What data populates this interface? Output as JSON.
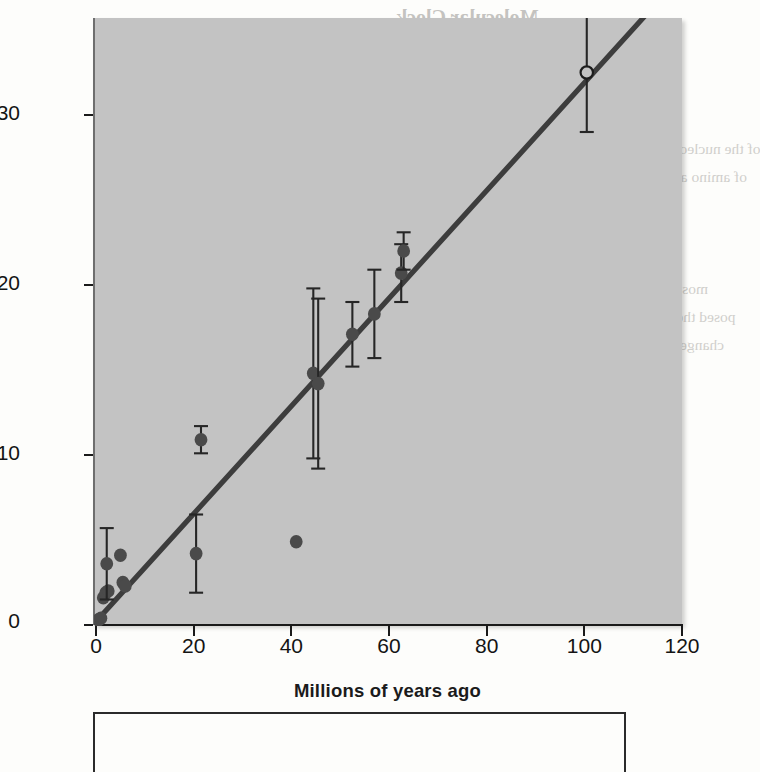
{
  "chart_data": {
    "type": "scatter",
    "title": "",
    "xlabel": "Millions of years ago",
    "ylabel": "Average number of amino acid replacements",
    "xlim": [
      0,
      120
    ],
    "ylim": [
      0,
      37
    ],
    "xticks": [
      0,
      20,
      40,
      60,
      80,
      100,
      120
    ],
    "yticks": [
      0,
      10,
      20,
      30
    ],
    "grid": false,
    "legend": "none",
    "series": [
      {
        "name": "Amino acid replacements vs divergence time",
        "marker": "filled-circle",
        "color": "#4a4a4a",
        "points": [
          {
            "x": 0.5,
            "y": 0.3,
            "err": 0.0
          },
          {
            "x": 1.0,
            "y": 0.4,
            "err": 0.0
          },
          {
            "x": 1.5,
            "y": 1.6,
            "err": 0.0
          },
          {
            "x": 2.0,
            "y": 1.9,
            "err": 0.0
          },
          {
            "x": 2.5,
            "y": 2.0,
            "err": 0.0
          },
          {
            "x": 2.2,
            "y": 3.6,
            "err": 2.1
          },
          {
            "x": 5.0,
            "y": 4.1,
            "err": 0.0
          },
          {
            "x": 5.5,
            "y": 2.5,
            "err": 0.0
          },
          {
            "x": 6.0,
            "y": 2.3,
            "err": 0.0
          },
          {
            "x": 20.5,
            "y": 4.2,
            "err": 2.3
          },
          {
            "x": 21.5,
            "y": 10.9,
            "err": 0.8
          },
          {
            "x": 41.0,
            "y": 4.9,
            "err": 0.0
          },
          {
            "x": 44.5,
            "y": 14.8,
            "err": 5.0
          },
          {
            "x": 45.5,
            "y": 14.2,
            "err": 5.0
          },
          {
            "x": 52.5,
            "y": 17.1,
            "err": 1.9
          },
          {
            "x": 57.0,
            "y": 18.3,
            "err": 2.6
          },
          {
            "x": 62.5,
            "y": 20.7,
            "err": 1.7
          },
          {
            "x": 63.0,
            "y": 22.0,
            "err": 1.1
          }
        ]
      },
      {
        "name": "Extrapolated divergence estimate",
        "marker": "open-circle",
        "color": "#2b2b2b",
        "points": [
          {
            "x": 100.5,
            "y": 32.5,
            "err": 3.5
          }
        ]
      }
    ],
    "trendline": {
      "name": "Molecular clock regression",
      "x_start": 0.0,
      "y_start": 0.2,
      "x_end": 118.0,
      "y_end": 37.6,
      "color": "#3d3d3d"
    }
  },
  "ghost_text": {
    "lines": [
      {
        "text": "Molecular Clock",
        "x": 396,
        "y": 6,
        "size": "big"
      },
      {
        "text": "Association with Neutral Changes",
        "x": 356,
        "y": 58,
        "size": "big"
      },
      {
        "text": "in Gene Sequences",
        "x": 416,
        "y": 88,
        "size": "big"
      },
      {
        "text": "of the nucleotide sequences of genes in a species and the number",
        "x": 358,
        "y": 140,
        "size": "body"
      },
      {
        "text": "of amino acid replacements in their protein products is usually",
        "x": 360,
        "y": 168,
        "size": "body"
      },
      {
        "text": "not greatly affected by natural selection",
        "x": 364,
        "y": 196,
        "size": "body"
      },
      {
        "text": "is the nucleotide seq",
        "x": 400,
        "y": 224,
        "size": "body"
      },
      {
        "text": "by neutral mutations that do not affect the pheno",
        "x": 356,
        "y": 252,
        "size": "body"
      },
      {
        "text": "most genetic variation in natural populations is due to the",
        "x": 352,
        "y": 280,
        "size": "body"
      },
      {
        "text": "posed the neutral theory of evolution. According to this theory,",
        "x": 346,
        "y": 308,
        "size": "body"
      },
      {
        "text": "changes that are not acted on by natural selection, leading to",
        "x": 350,
        "y": 336,
        "size": "body"
      },
      {
        "text": "sequences of genes. Therefore, most mutations have",
        "x": 356,
        "y": 364,
        "size": "body"
      },
      {
        "text": "generations the variation is lost by genetic drift",
        "x": 360,
        "y": 392,
        "size": "body"
      },
      {
        "text": "in individuals with the same fitness. Unless a",
        "x": 362,
        "y": 420,
        "size": "body"
      },
      {
        "text": "for neutral changes unaffected by natural selection",
        "x": 356,
        "y": 448,
        "size": "body"
      },
      {
        "text": "and so are free to accumulate by genetic drift",
        "x": 358,
        "y": 476,
        "size": "body"
      },
      {
        "text": "changes in the protein are not acted on by selection",
        "x": 354,
        "y": 504,
        "size": "body"
      }
    ]
  },
  "caption": {
    "text": ""
  }
}
